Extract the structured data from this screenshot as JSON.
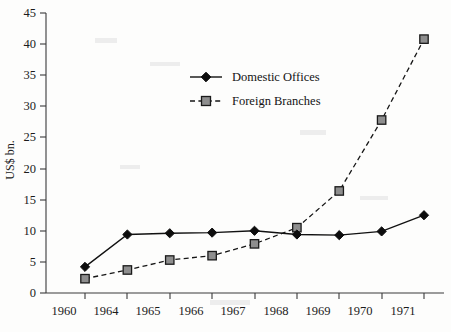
{
  "chart_data": {
    "type": "line",
    "title": "",
    "xlabel": "",
    "ylabel": "US$ bn.",
    "categories": [
      "1960",
      "1964",
      "1965",
      "1966",
      "1967",
      "1968",
      "1969",
      "1970",
      "1971"
    ],
    "ylim": [
      0,
      45
    ],
    "ytick_step": 5,
    "yticks": [
      "0",
      "5",
      "10",
      "15",
      "20",
      "25",
      "30",
      "35",
      "40",
      "45"
    ],
    "grid": false,
    "legend_position": "upper-center-left",
    "series": [
      {
        "name": "Domestic Offices",
        "marker": "filled-diamond",
        "line_style": "solid",
        "color": "#111111",
        "values": [
          4.2,
          9.4,
          9.6,
          9.7,
          10.0,
          9.4,
          9.3,
          9.9,
          12.5
        ]
      },
      {
        "name": "Foreign Branches",
        "marker": "open-square",
        "line_style": "dashed",
        "color": "#161616",
        "values": [
          2.3,
          3.7,
          5.3,
          6.0,
          7.9,
          10.5,
          16.4,
          27.8,
          40.8
        ]
      }
    ]
  },
  "axis": {
    "y_label": "US$ bn."
  },
  "legend": {
    "entries": [
      {
        "label": "Domestic Offices"
      },
      {
        "label": "Foreign Branches"
      }
    ]
  }
}
